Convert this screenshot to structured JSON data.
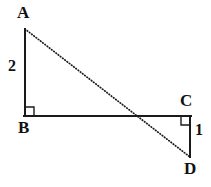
{
  "figure": {
    "name": "two-right-triangles-diagram",
    "canvas": {
      "width": 211,
      "height": 187
    },
    "stroke_color": "#1a1a1a",
    "background_color": "#ffffff",
    "solid_stroke_width": 2,
    "dotted_stroke_width": 1.6
  },
  "vertices": [
    {
      "id": "A",
      "label": "A",
      "x": 25,
      "y": 29
    },
    {
      "id": "B",
      "label": "B",
      "x": 25,
      "y": 116
    },
    {
      "id": "C",
      "label": "C",
      "x": 190,
      "y": 116
    },
    {
      "id": "D",
      "label": "D",
      "x": 190,
      "y": 157
    }
  ],
  "segments": [
    {
      "id": "AB",
      "from": "A",
      "to": "B",
      "style": "solid",
      "x1": 25,
      "y1": 29,
      "x2": 25,
      "y2": 116
    },
    {
      "id": "BC",
      "from": "B",
      "to": "C",
      "style": "solid",
      "x1": 25,
      "y1": 116,
      "x2": 190,
      "y2": 116
    },
    {
      "id": "CD",
      "from": "C",
      "to": "D",
      "style": "solid",
      "x1": 190,
      "y1": 116,
      "x2": 190,
      "y2": 157
    },
    {
      "id": "AD",
      "from": "A",
      "to": "D",
      "style": "dotted",
      "x1": 25,
      "y1": 29,
      "x2": 190,
      "y2": 157
    }
  ],
  "length_labels": [
    {
      "id": "AB",
      "segment": "AB",
      "value": "2",
      "x": 8,
      "y": 58
    },
    {
      "id": "CD",
      "segment": "CD",
      "value": "1",
      "x": 195,
      "y": 122
    }
  ],
  "right_angle_marks": [
    {
      "id": "at-B",
      "vertex": "B",
      "x": 25,
      "y": 116,
      "size": 9,
      "dir_x": 1,
      "dir_y": -1
    },
    {
      "id": "at-C",
      "vertex": "C",
      "x": 190,
      "y": 116,
      "size": 9,
      "dir_x": -1,
      "dir_y": 1
    }
  ],
  "intersection": {
    "id": "AD-crosses-BC",
    "x": 140,
    "y": 116
  }
}
